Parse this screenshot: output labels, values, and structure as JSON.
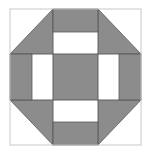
{
  "diagram": {
    "title": "Churn Dash quilt block",
    "colors": {
      "fill": "#8c8c8c",
      "background": "#ffffff",
      "outer_border": "#c8c8c8",
      "seam": "#5a5a5a"
    },
    "grid": {
      "x": [
        10,
        32,
        53,
        98,
        119,
        141
      ],
      "y": [
        9,
        32,
        54,
        100,
        122,
        145
      ]
    },
    "pieces": [
      {
        "name": "corner-top-left-triangle",
        "type": "triangle",
        "points": "10,54 53,9 53,54"
      },
      {
        "name": "corner-top-right-triangle",
        "type": "triangle",
        "points": "98,9 141,54 98,54"
      },
      {
        "name": "corner-bottom-left-triangle",
        "type": "triangle",
        "points": "10,100 53,100 53,145"
      },
      {
        "name": "corner-bottom-right-triangle",
        "type": "triangle",
        "points": "98,100 141,100 98,145"
      },
      {
        "name": "top-bar",
        "type": "rect",
        "x": 53,
        "y": 9,
        "w": 45,
        "h": 23
      },
      {
        "name": "bottom-bar",
        "type": "rect",
        "x": 53,
        "y": 122,
        "w": 45,
        "h": 23
      },
      {
        "name": "left-bar",
        "type": "rect",
        "x": 10,
        "y": 54,
        "w": 22,
        "h": 46
      },
      {
        "name": "right-bar",
        "type": "rect",
        "x": 119,
        "y": 54,
        "w": 22,
        "h": 46
      },
      {
        "name": "center-square",
        "type": "rect",
        "x": 53,
        "y": 54,
        "w": 45,
        "h": 46
      }
    ]
  }
}
